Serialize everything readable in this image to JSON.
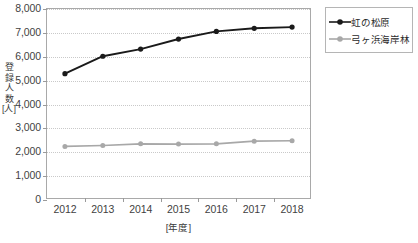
{
  "chart_data": {
    "type": "line",
    "title": "",
    "xlabel": "[年度]",
    "ylabel": "登録人数 [人]",
    "ylabel_chars": [
      "登",
      "録",
      "人",
      "数",
      "[人]"
    ],
    "categories": [
      "2012",
      "2013",
      "2014",
      "2015",
      "2016",
      "2017",
      "2018"
    ],
    "x": [
      2012,
      2013,
      2014,
      2015,
      2016,
      2017,
      2018
    ],
    "ylim": [
      0,
      8000
    ],
    "yticks": [
      0,
      1000,
      2000,
      3000,
      4000,
      5000,
      6000,
      7000,
      8000
    ],
    "ytick_labels": [
      "0",
      "1,000",
      "2,000",
      "3,000",
      "4,000",
      "5,000",
      "6,000",
      "7,000",
      "8,000"
    ],
    "grid": true,
    "legend_position": "right-top",
    "series": [
      {
        "name": "虹の松原",
        "color": "#1a1a1a",
        "marker": "circle",
        "values": [
          5250,
          5980,
          6280,
          6700,
          7020,
          7150,
          7200
        ]
      },
      {
        "name": "弓ヶ浜海岸林",
        "color": "#a8a8a8",
        "marker": "circle",
        "values": [
          2200,
          2240,
          2310,
          2300,
          2310,
          2420,
          2440
        ]
      }
    ]
  },
  "legend": {
    "items": [
      {
        "label": "虹の松原"
      },
      {
        "label": "弓ヶ浜海岸林"
      }
    ]
  },
  "colors": {
    "series_black": "#1a1a1a",
    "series_gray": "#a8a8a8",
    "frame": "#a9a9a9",
    "grid": "#c9c9c9",
    "text": "#3f3f3f"
  }
}
